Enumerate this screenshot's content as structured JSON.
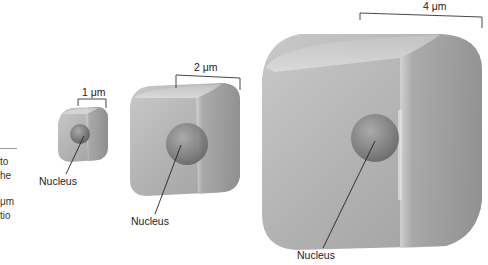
{
  "figure": {
    "side_text": {
      "lines": [
        "to",
        "he",
        "μm",
        "tio"
      ]
    },
    "cells": [
      {
        "id": "small",
        "scale_label": "1 μm",
        "scale_value": 1,
        "nucleus_label": "Nucleus"
      },
      {
        "id": "medium",
        "scale_label": "2 μm",
        "scale_value": 2,
        "nucleus_label": "Nucleus"
      },
      {
        "id": "large",
        "scale_label": "4 μm",
        "scale_value": 4,
        "nucleus_label": "Nucleus"
      }
    ],
    "colors": {
      "cell_light": "#d6d6d6",
      "cell_mid": "#b4b4b4",
      "cell_dark": "#8e8e8e",
      "nucleus": "#7a7a7a",
      "line": "#222222"
    }
  }
}
